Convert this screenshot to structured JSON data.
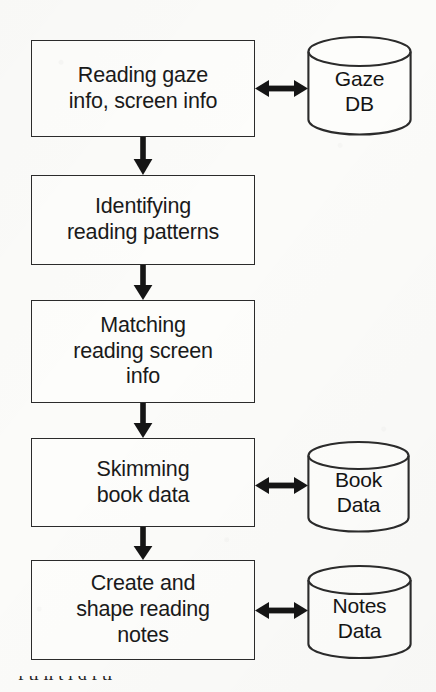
{
  "diagram": {
    "type": "flowchart",
    "background_color": "#fbfbf9",
    "stroke_color": "#2b2b2b",
    "text_color": "#1a1a1a",
    "process_boxes": [
      {
        "id": "reading-gaze-info",
        "label": "Reading gaze\ninfo, screen info"
      },
      {
        "id": "identifying-reading-patterns",
        "label": "Identifying\nreading patterns"
      },
      {
        "id": "matching-reading-screen-info",
        "label": "Matching\nreading screen\ninfo"
      },
      {
        "id": "skimming-book-data",
        "label": "Skimming\nbook data"
      },
      {
        "id": "create-shape-reading-notes",
        "label": "Create and\nshape reading\nnotes"
      }
    ],
    "databases": [
      {
        "id": "gaze-db",
        "label": "Gaze\nDB"
      },
      {
        "id": "book-data-db",
        "label": "Book\nData"
      },
      {
        "id": "notes-data-db",
        "label": "Notes\nData"
      }
    ],
    "flow_arrows": [
      {
        "from": "reading-gaze-info",
        "to": "identifying-reading-patterns",
        "direction": "down"
      },
      {
        "from": "identifying-reading-patterns",
        "to": "matching-reading-screen-info",
        "direction": "down"
      },
      {
        "from": "matching-reading-screen-info",
        "to": "skimming-book-data",
        "direction": "down"
      },
      {
        "from": "skimming-book-data",
        "to": "create-shape-reading-notes",
        "direction": "down"
      }
    ],
    "data_arrows": [
      {
        "between": [
          "reading-gaze-info",
          "gaze-db"
        ],
        "direction": "bidirectional"
      },
      {
        "between": [
          "skimming-book-data",
          "book-data-db"
        ],
        "direction": "bidirectional"
      },
      {
        "between": [
          "create-shape-reading-notes",
          "notes-data-db"
        ],
        "direction": "bidirectional"
      }
    ]
  },
  "caption": {
    "cropped_text": "f ti  li     t  l    d f   ti"
  }
}
